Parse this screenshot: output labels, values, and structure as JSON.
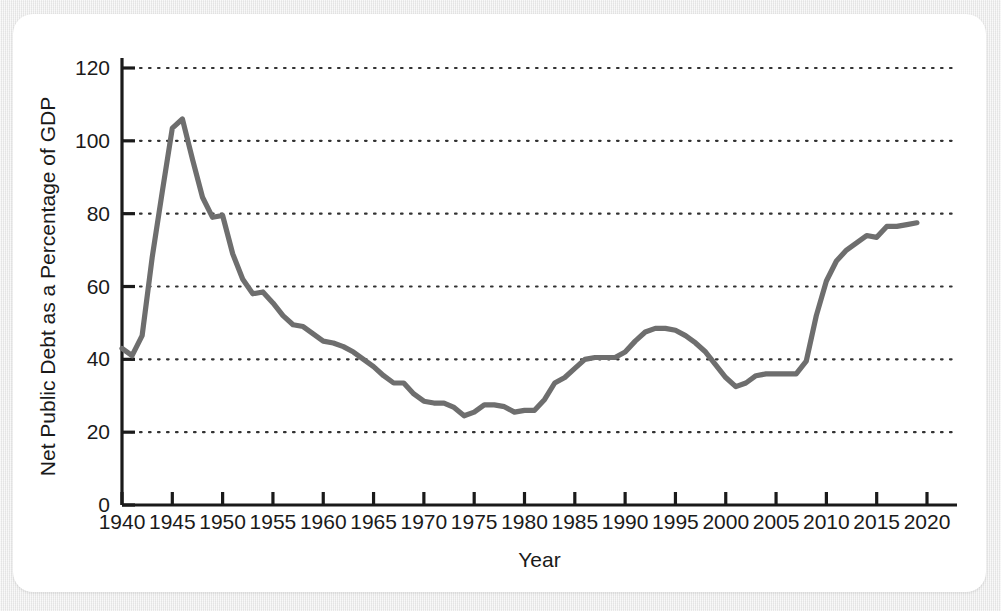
{
  "figure": {
    "background_color": "#ebebeb",
    "card_color": "#ffffff"
  },
  "chart_data": {
    "type": "line",
    "title": "",
    "xlabel": "Year",
    "ylabel": "Net Public Debt as a Percentage of GDP",
    "xlim": [
      1938,
      2022
    ],
    "ylim": [
      0,
      125
    ],
    "grid": "horizontal-dotted",
    "legend": "none",
    "line_color": "#6e6e6e",
    "axis_color": "#1a1a1a",
    "grid_color": "#333333",
    "xticks": [
      1940,
      1945,
      1950,
      1955,
      1960,
      1965,
      1970,
      1975,
      1980,
      1985,
      1990,
      1995,
      2000,
      2005,
      2010,
      2015,
      2020
    ],
    "xtick_labels": [
      "1940",
      "1945",
      "1950",
      "1955",
      "1960",
      "1965",
      "1970",
      "1975",
      "1980",
      "1985",
      "1990",
      "1995",
      "2000",
      "2005",
      "2010",
      "2015",
      "2020"
    ],
    "yticks": [
      0,
      20,
      40,
      60,
      80,
      100,
      120
    ],
    "ytick_labels": [
      "0",
      "20",
      "40",
      "60",
      "80",
      "100",
      "120"
    ],
    "gridlines_at": [
      20,
      40,
      60,
      80,
      100,
      120
    ],
    "series": [
      {
        "name": "Net Public Debt as a Percentage of GDP",
        "x": [
          1940,
          1941,
          1942,
          1943,
          1944,
          1945,
          1946,
          1947,
          1948,
          1949,
          1950,
          1951,
          1952,
          1953,
          1954,
          1955,
          1956,
          1957,
          1958,
          1959,
          1960,
          1961,
          1962,
          1963,
          1964,
          1965,
          1966,
          1967,
          1968,
          1969,
          1970,
          1971,
          1972,
          1973,
          1974,
          1975,
          1976,
          1977,
          1978,
          1979,
          1980,
          1981,
          1982,
          1983,
          1984,
          1985,
          1986,
          1987,
          1988,
          1989,
          1990,
          1991,
          1992,
          1993,
          1994,
          1995,
          1996,
          1997,
          1998,
          1999,
          2000,
          2001,
          2002,
          2003,
          2004,
          2005,
          2006,
          2007,
          2008,
          2009,
          2010,
          2011,
          2012,
          2013,
          2014,
          2015,
          2016,
          2017,
          2018,
          2019
        ],
        "values": [
          43.0,
          41.0,
          46.5,
          68.0,
          86.0,
          103.5,
          106.0,
          95.0,
          84.5,
          79.0,
          79.5,
          69.0,
          62.0,
          58.0,
          58.5,
          55.5,
          52.0,
          49.5,
          49.0,
          47.0,
          45.0,
          44.5,
          43.5,
          42.0,
          40.0,
          38.0,
          35.5,
          33.5,
          33.5,
          30.5,
          28.5,
          28.0,
          28.0,
          26.8,
          24.5,
          25.5,
          27.5,
          27.5,
          27.0,
          25.5,
          26.0,
          26.0,
          29.0,
          33.5,
          35.0,
          37.5,
          40.0,
          40.5,
          40.5,
          40.5,
          42.0,
          45.0,
          47.5,
          48.5,
          48.5,
          48.0,
          46.5,
          44.5,
          42.0,
          38.5,
          35.0,
          32.5,
          33.5,
          35.5,
          36.0,
          36.0,
          36.0,
          36.0,
          39.5,
          52.0,
          61.5,
          67.0,
          70.0,
          72.0,
          74.0,
          73.5,
          76.5,
          76.5,
          77.0,
          77.5
        ]
      }
    ]
  }
}
